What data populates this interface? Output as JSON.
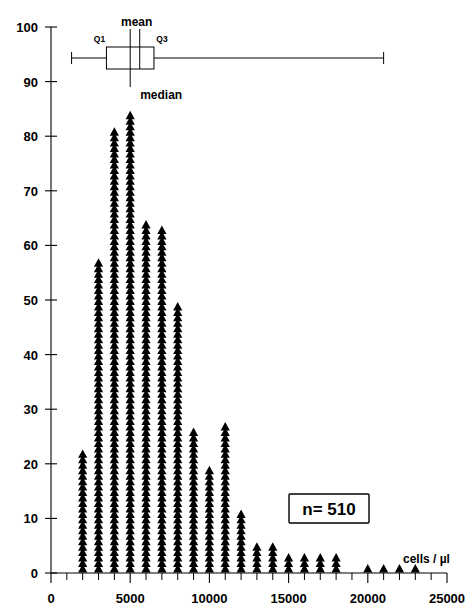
{
  "chart_data": {
    "type": "bar",
    "title": "",
    "subtitle": "",
    "xlabel": "cells / µl",
    "ylabel": "",
    "xlim": [
      0,
      25000
    ],
    "ylim": [
      0,
      100
    ],
    "x_major_ticks": [
      0,
      5000,
      10000,
      15000,
      20000,
      25000
    ],
    "x_major_tick_labels": [
      "0",
      "5000",
      "10000",
      "15000",
      "20000",
      "25000"
    ],
    "x_minor_tick_step": 1000,
    "y_ticks": [
      0,
      10,
      20,
      30,
      40,
      50,
      60,
      70,
      80,
      90,
      100
    ],
    "y_tick_labels": [
      "0",
      "10",
      "20",
      "30",
      "40",
      "50",
      "60",
      "70",
      "80",
      "90",
      "100"
    ],
    "grid": false,
    "legend": "none",
    "marker_style": "triangle-stack",
    "bin_width": 1000,
    "x": [
      2000,
      3000,
      4000,
      5000,
      6000,
      7000,
      8000,
      9000,
      10000,
      11000,
      12000,
      13000,
      14000,
      15000,
      16000,
      17000,
      18000,
      19000,
      20000,
      21000,
      22000,
      23000
    ],
    "values": [
      22,
      57,
      81,
      84,
      64,
      63,
      49,
      26,
      19,
      27,
      11,
      5,
      5,
      3,
      3,
      3,
      3,
      0,
      1,
      1,
      1,
      1
    ],
    "annotations": {
      "sample_size": "n= 510"
    },
    "boxplot": {
      "orientation": "horizontal",
      "whisker_low": 1300,
      "q1": 3500,
      "median": 5000,
      "mean": 5600,
      "q3": 6500,
      "whisker_high": 21000,
      "labels": {
        "q1": "Q1",
        "q3": "Q3",
        "mean": "mean",
        "median": "median"
      }
    },
    "colors": {
      "marker": "#000000",
      "axis": "#000000",
      "background": "#ffffff"
    }
  }
}
